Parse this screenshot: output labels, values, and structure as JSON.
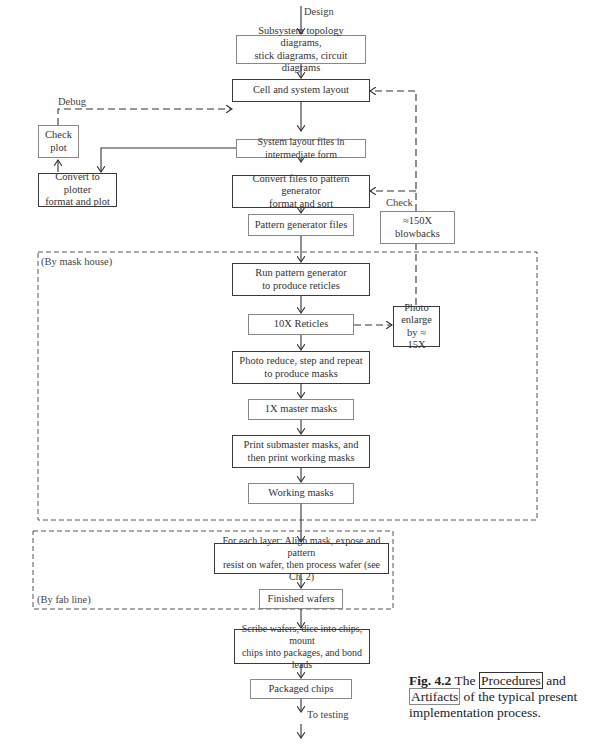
{
  "figure": {
    "number": "Fig. 4.2",
    "caption_pre": "The",
    "caption_procedures": "Procedures",
    "caption_and": "and",
    "caption_artifacts": "Artifacts",
    "caption_post": "of the typical present implementation process.",
    "legend": {
      "procedure_style": "thick border box",
      "artifact_style": "thin border box"
    }
  },
  "labels": {
    "design": "Design",
    "debug": "Debug",
    "check": "Check",
    "by_mask_house": "(By mask house)",
    "by_fab_line": "(By fab line)",
    "to_testing": "To testing"
  },
  "nodes": {
    "subsystem_diagrams": {
      "type": "artifact",
      "line1": "Subsystem topology diagrams,",
      "line2": "stick diagrams, circuit diagrams"
    },
    "cell_system_layout": {
      "type": "procedure",
      "line1": "Cell and system layout"
    },
    "check_plot": {
      "type": "artifact",
      "line1": "Check",
      "line2": "plot"
    },
    "layout_files": {
      "type": "artifact",
      "line1": "System layout files in intermediate form"
    },
    "convert_plotter": {
      "type": "procedure",
      "line1": "Convert to plotter",
      "line2": "format and plot"
    },
    "convert_pg": {
      "type": "procedure",
      "line1": "Convert files to pattern generator",
      "line2": "format and sort"
    },
    "blowbacks": {
      "type": "artifact",
      "line1": "≈150X",
      "line2": "blowbacks"
    },
    "pg_files": {
      "type": "artifact",
      "line1": "Pattern generator files"
    },
    "run_pg": {
      "type": "procedure",
      "line1": "Run pattern generator",
      "line2": "to produce reticles"
    },
    "reticles": {
      "type": "artifact",
      "line1": "10X Reticles"
    },
    "photo_enlarge": {
      "type": "procedure",
      "line1": "Photo",
      "line2": "enlarge",
      "line3": "by ≈ 15X"
    },
    "photo_reduce": {
      "type": "procedure",
      "line1": "Photo reduce, step and repeat",
      "line2": "to produce masks"
    },
    "master_masks": {
      "type": "artifact",
      "line1": "1X master masks"
    },
    "print_masks": {
      "type": "procedure",
      "line1": "Print submaster masks, and",
      "line2": "then print working masks"
    },
    "working_masks": {
      "type": "artifact",
      "line1": "Working masks"
    },
    "process_wafer": {
      "type": "procedure",
      "line1": "For each layer: Align mask, expose and pattern",
      "line2": "resist on wafer, then process wafer (see Ch. 2)"
    },
    "finished_wafers": {
      "type": "artifact",
      "line1": "Finished wafers"
    },
    "scribe": {
      "type": "procedure",
      "line1": "Scribe wafers, dice into chips, mount",
      "line2": "chips into packages, and bond leads"
    },
    "packaged_chips": {
      "type": "artifact",
      "line1": "Packaged chips"
    }
  }
}
